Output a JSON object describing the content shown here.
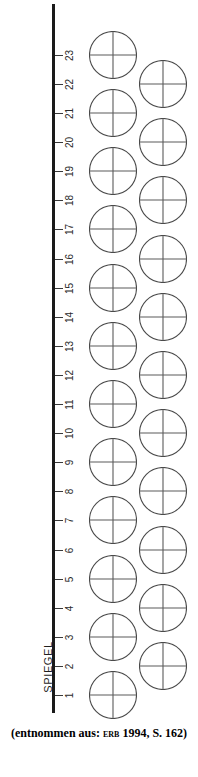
{
  "figure": {
    "axis": {
      "title": "SPIEGEL",
      "tick_labels": [
        "1",
        "2",
        "3",
        "4",
        "5",
        "6",
        "7",
        "8",
        "9",
        "10",
        "11",
        "12",
        "13",
        "14",
        "15",
        "16",
        "17",
        "18",
        "19",
        "20",
        "21",
        "22",
        "23"
      ],
      "tick_count": 23,
      "orientation": "vertical",
      "direction": "bottom-to-top",
      "line_color": "#1a1a1a"
    },
    "nodes": {
      "symbol": "circle-with-crosshair",
      "left_column_ticks": [
        1,
        3,
        5,
        7,
        9,
        11,
        13,
        15,
        17,
        19,
        21,
        23
      ],
      "right_column_ticks": [
        2,
        4,
        6,
        8,
        10,
        12,
        14,
        16,
        18,
        20,
        22
      ],
      "stroke_color": "#4a4a4a",
      "fill": "none"
    }
  },
  "caption": {
    "prefix": "(entnommen aus: ",
    "author": "Erb",
    "year": "1994",
    "page": ", S. 162)",
    "full_text": "(entnommen aus: ERB 1994, S. 162)"
  }
}
